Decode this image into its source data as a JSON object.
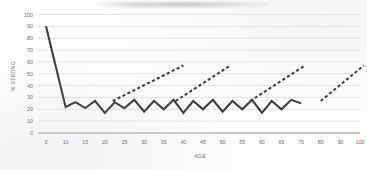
{
  "chart_data": {
    "type": "line",
    "title": "",
    "xlabel": "AGE",
    "ylabel": "% STRONG",
    "xlim": [
      0,
      105
    ],
    "ylim": [
      0,
      100
    ],
    "grid": true,
    "legend": "none",
    "y_ticks": [
      0,
      10,
      20,
      30,
      40,
      50,
      60,
      70,
      80,
      90,
      100
    ],
    "x_ticks": [
      5,
      10,
      15,
      20,
      25,
      30,
      35,
      40,
      45,
      50,
      55,
      60,
      65,
      70,
      80,
      90,
      100
    ],
    "series": [
      {
        "name": "solid-sawtooth",
        "style": "solid",
        "color": "#3b3b3b",
        "x": [
          5,
          10,
          12.5,
          15,
          17.5,
          20,
          22.5,
          25,
          27.5,
          30,
          32.5,
          35,
          37.5,
          40,
          42.5,
          45,
          47.5,
          50,
          52.5,
          55,
          57.5,
          60,
          62.5,
          65,
          67.5,
          70
        ],
        "y": [
          90,
          22,
          26,
          21,
          27,
          17,
          26,
          21,
          28,
          18,
          27,
          20,
          28,
          17,
          27,
          20,
          28,
          18,
          27,
          20,
          28,
          17,
          27,
          20,
          28,
          25
        ]
      },
      {
        "name": "dashed-trend-1",
        "style": "dashed",
        "color": "#3b3b3b",
        "x": [
          22,
          40
        ],
        "y": [
          27,
          57
        ]
      },
      {
        "name": "dashed-trend-2",
        "style": "dashed",
        "color": "#3b3b3b",
        "x": [
          38,
          52
        ],
        "y": [
          27,
          57
        ]
      },
      {
        "name": "dashed-trend-3",
        "style": "dashed",
        "color": "#3b3b3b",
        "x": [
          57,
          72
        ],
        "y": [
          27,
          57
        ]
      },
      {
        "name": "dashed-trend-4",
        "style": "dashed",
        "color": "#3b3b3b",
        "x": [
          80,
          102
        ],
        "y": [
          27,
          57
        ]
      }
    ]
  },
  "axes": {
    "y_title": "% STRONG",
    "x_title": "AGE",
    "y_tick_labels": [
      "0",
      "10",
      "20",
      "30",
      "40",
      "50",
      "60",
      "70",
      "80",
      "90",
      "100"
    ],
    "x_tick_labels": [
      "5",
      "10",
      "15",
      "20",
      "25",
      "30",
      "35",
      "40",
      "45",
      "50",
      "55",
      "60",
      "65",
      "70",
      "80",
      "90",
      "100"
    ]
  },
  "colors": {
    "background": "#fdfdfd",
    "gridline": "#d8d8d8",
    "baseline": "#9d9d9d",
    "series": "#3b3b3b",
    "tick_label": "#6d6d6d"
  }
}
